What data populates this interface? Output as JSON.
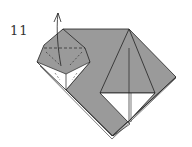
{
  "diagram": {
    "step_number": "11",
    "colors": {
      "paper_colored": "#9a9a9a",
      "paper_white": "#ffffff",
      "line": "#222222"
    },
    "annotations": {
      "arrow": "fold-up-arrow",
      "dashed_line": "valley-fold-line"
    }
  }
}
